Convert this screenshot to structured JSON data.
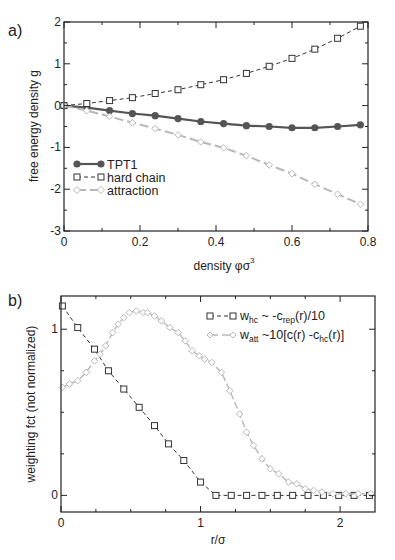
{
  "panels": {
    "a": {
      "label": "a)",
      "xlabel": "density φσ",
      "xlabel_sup": "3",
      "ylabel": "free energy density g",
      "xticks": [
        "0",
        "0.2",
        "0.4",
        "0.6",
        "0.8"
      ],
      "yticks": [
        "-3",
        "-2",
        "-1",
        "0",
        "1",
        "2"
      ],
      "legend": [
        "TPT1",
        "hard chain",
        "attraction"
      ]
    },
    "b": {
      "label": "b)",
      "xlabel": "r/σ",
      "ylabel": "weighting fct (not normalized)",
      "xticks": [
        "0",
        "1",
        "2"
      ],
      "yticks": [
        "0",
        "1"
      ],
      "legend_hc": {
        "main": "w",
        "sub": "hc",
        "rest1": " ~ -c",
        "sub2": "rep",
        "rest2": "(r)/10"
      },
      "legend_att": {
        "main": "w",
        "sub": "att",
        "rest1": " ~10[c(r) -c",
        "sub2": "hc",
        "rest2": "(r)]"
      }
    }
  },
  "colors": {
    "tpt1": "#555555",
    "hard_chain": "#333333",
    "attraction": "#b8b8b8",
    "axis": "#222222"
  },
  "chart_data": [
    {
      "type": "line",
      "title": "a)",
      "xlabel": "density φσ^3",
      "ylabel": "free energy density g",
      "xlim": [
        0,
        0.8
      ],
      "ylim": [
        -3,
        2
      ],
      "grid": false,
      "legend_position": "lower left",
      "x": [
        0,
        0.06,
        0.12,
        0.18,
        0.24,
        0.3,
        0.36,
        0.42,
        0.48,
        0.54,
        0.6,
        0.66,
        0.72,
        0.78
      ],
      "series": [
        {
          "name": "TPT1",
          "marker": "filled-circle",
          "line": "solid",
          "values": [
            0,
            -0.05,
            -0.12,
            -0.19,
            -0.24,
            -0.31,
            -0.38,
            -0.43,
            -0.48,
            -0.5,
            -0.53,
            -0.53,
            -0.5,
            -0.46
          ]
        },
        {
          "name": "hard chain",
          "marker": "open-square",
          "line": "dashed",
          "values": [
            0,
            0.05,
            0.12,
            0.19,
            0.29,
            0.38,
            0.5,
            0.62,
            0.77,
            0.94,
            1.13,
            1.35,
            1.61,
            1.9
          ]
        },
        {
          "name": "attraction",
          "marker": "open-diamond",
          "line": "long-dash",
          "values": [
            0,
            -0.12,
            -0.26,
            -0.41,
            -0.55,
            -0.7,
            -0.87,
            -1.01,
            -1.2,
            -1.42,
            -1.63,
            -1.88,
            -2.12,
            -2.36
          ]
        }
      ]
    },
    {
      "type": "line",
      "title": "b)",
      "xlabel": "r/σ",
      "ylabel": "weighting fct (not normalized)",
      "xlim": [
        0,
        2.25
      ],
      "ylim": [
        -0.1,
        1.2
      ],
      "grid": false,
      "legend_position": "upper right",
      "series": [
        {
          "name": "w_hc ~ -c_rep(r)/10",
          "marker": "open-square",
          "line": "dashed",
          "x": [
            0.01,
            0.12,
            0.24,
            0.34,
            0.45,
            0.56,
            0.67,
            0.77,
            0.88,
            1.0,
            1.11,
            1.22,
            1.33,
            1.44,
            1.55,
            1.66,
            1.77,
            1.88,
            1.99,
            2.1,
            2.21
          ],
          "values": [
            1.14,
            1.01,
            0.88,
            0.75,
            0.64,
            0.53,
            0.42,
            0.31,
            0.21,
            0.08,
            0,
            0,
            0,
            0,
            0,
            0,
            0,
            0,
            0,
            0,
            0
          ]
        },
        {
          "name": "w_att ~10[c(r) -c_hc(r)]",
          "marker": "open-diamond",
          "line": "long-dash",
          "x": [
            0.01,
            0.06,
            0.12,
            0.18,
            0.24,
            0.28,
            0.32,
            0.37,
            0.41,
            0.45,
            0.49,
            0.54,
            0.59,
            0.62,
            0.67,
            0.72,
            0.78,
            0.84,
            0.89,
            0.94,
            0.99,
            1.03,
            1.08,
            1.15,
            1.21,
            1.28,
            1.33,
            1.38,
            1.44,
            1.5,
            1.56,
            1.63,
            1.69,
            1.75,
            1.81,
            1.87,
            1.95,
            2.04,
            2.13,
            2.22
          ],
          "values": [
            0.65,
            0.67,
            0.69,
            0.74,
            0.81,
            0.85,
            0.9,
            0.98,
            1.03,
            1.07,
            1.1,
            1.11,
            1.1,
            1.1,
            1.08,
            1.05,
            1.01,
            0.98,
            0.93,
            0.87,
            0.84,
            0.82,
            0.8,
            0.74,
            0.63,
            0.49,
            0.38,
            0.3,
            0.22,
            0.16,
            0.13,
            0.08,
            0.07,
            0.04,
            0.03,
            0.02,
            0.01,
            0.01,
            0.01,
            0.01
          ]
        }
      ]
    }
  ]
}
